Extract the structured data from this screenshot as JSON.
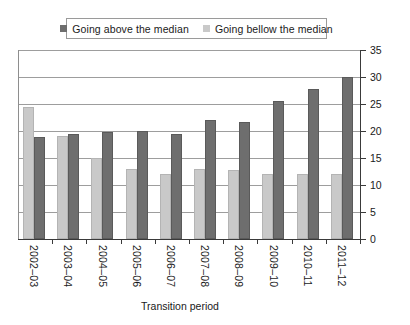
{
  "legend": {
    "entries": [
      {
        "label": "Going above the median",
        "color": "#6e6e6e",
        "key": "above"
      },
      {
        "label": "Going bellow the median",
        "color": "#c9c9c9",
        "key": "below"
      }
    ]
  },
  "axes": {
    "x_title": "Transition period",
    "y_ticks": [
      "0",
      "5",
      "10",
      "15",
      "20",
      "25",
      "30",
      "35"
    ]
  },
  "chart_data": {
    "type": "bar",
    "title": "",
    "xlabel": "Transition period",
    "ylabel": "",
    "ylim": [
      0,
      35
    ],
    "ytick_step": 5,
    "grid": true,
    "legend_position": "top",
    "categories": [
      "2002–03",
      "2003–04",
      "2004–05",
      "2005–06",
      "2006–07",
      "2007–08",
      "2008–09",
      "2009–10",
      "2010–11",
      "2011–12"
    ],
    "series": [
      {
        "name": "Going above the median",
        "color": "#6e6e6e",
        "values": [
          18.8,
          19.5,
          19.8,
          20.0,
          19.5,
          22.0,
          21.7,
          25.5,
          27.7,
          30.0
        ]
      },
      {
        "name": "Going bellow the median",
        "color": "#c9c9c9",
        "values": [
          24.5,
          19.0,
          15.0,
          13.0,
          12.0,
          13.0,
          12.7,
          12.0,
          12.0,
          12.0
        ]
      }
    ]
  }
}
